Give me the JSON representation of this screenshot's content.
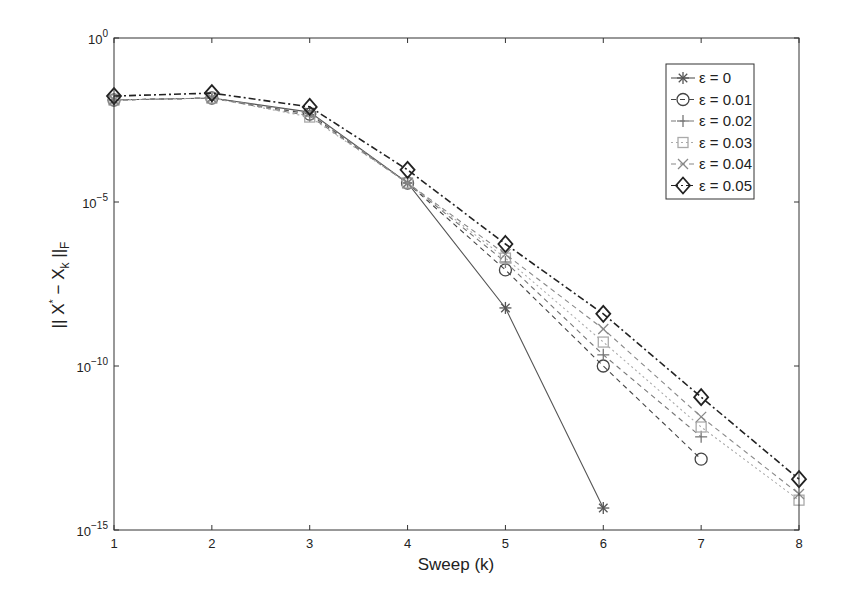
{
  "chart_data": {
    "type": "line",
    "title": "",
    "xlabel": "Sweep (k)",
    "ylabel": "|| X* − X_k ||_F",
    "yscale": "log",
    "xlim": [
      1,
      8
    ],
    "ylim_exponent": [
      -15,
      0
    ],
    "x_ticks": [
      "1",
      "2",
      "3",
      "4",
      "5",
      "6",
      "7",
      "8"
    ],
    "y_ticks": [
      "10^0",
      "10^-5",
      "10^-10",
      "10^-15"
    ],
    "grid": false,
    "legend_position": "upper right",
    "series": [
      {
        "name": "ε = 0",
        "marker": "asterisk",
        "line": "solid",
        "color": "#555555",
        "x": [
          1,
          2,
          3,
          4,
          5,
          6
        ],
        "log10_values": [
          -1.89,
          -1.83,
          -2.26,
          -4.42,
          -8.23,
          -14.33
        ]
      },
      {
        "name": "ε = 0.01",
        "marker": "circle",
        "line": "dashed",
        "color": "#444444",
        "x": [
          1,
          2,
          3,
          4,
          5,
          6,
          7
        ],
        "log10_values": [
          -1.89,
          -1.83,
          -2.32,
          -4.42,
          -7.07,
          -10.0,
          -12.84
        ]
      },
      {
        "name": "ε = 0.02",
        "marker": "plus",
        "line": "dashed",
        "color": "#777777",
        "x": [
          1,
          2,
          3,
          4,
          5,
          6,
          7
        ],
        "log10_values": [
          -1.89,
          -1.83,
          -2.38,
          -4.42,
          -6.83,
          -9.66,
          -12.16
        ]
      },
      {
        "name": "ε = 0.03",
        "marker": "square",
        "line": "dotted",
        "color": "#aaaaaa",
        "x": [
          1,
          2,
          3,
          4,
          5,
          6,
          7,
          8
        ],
        "log10_values": [
          -1.89,
          -1.83,
          -2.41,
          -4.42,
          -6.71,
          -9.27,
          -11.86,
          -14.09
        ]
      },
      {
        "name": "ε = 0.04",
        "marker": "x",
        "line": "dashed",
        "color": "#888888",
        "x": [
          1,
          2,
          3,
          4,
          5,
          6,
          7,
          8
        ],
        "log10_values": [
          -1.89,
          -1.83,
          -2.29,
          -4.42,
          -6.59,
          -8.87,
          -11.55,
          -13.9
        ]
      },
      {
        "name": "ε = 0.05",
        "marker": "diamond",
        "line": "dashdot",
        "color": "#222222",
        "x": [
          1,
          2,
          3,
          4,
          5,
          6,
          7,
          8
        ],
        "log10_values": [
          -1.77,
          -1.68,
          -2.1,
          -4.02,
          -6.28,
          -8.41,
          -10.95,
          -13.45
        ]
      }
    ]
  },
  "axes": {
    "xlabel": "Sweep (k)",
    "ylabel_parts": {
      "bars": "||",
      "x": "X",
      "star": "*",
      "minus": " − ",
      "xk": "X",
      "k": "k",
      "bars2": " ||",
      "f": "F"
    },
    "y_tick_base": "10",
    "y_tick_exps": [
      "0",
      "−5",
      "−10",
      "−15"
    ],
    "x_tick_labels": [
      "1",
      "2",
      "3",
      "4",
      "5",
      "6",
      "7",
      "8"
    ]
  },
  "legend": {
    "entries": [
      "ε = 0",
      "ε = 0.01",
      "ε = 0.02",
      "ε = 0.03",
      "ε = 0.04",
      "ε = 0.05"
    ]
  }
}
